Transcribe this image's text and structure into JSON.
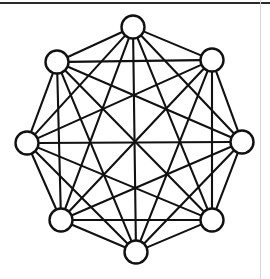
{
  "figure": {
    "title": "",
    "type": "graph-diagram",
    "background_color": "#ffffff",
    "ink_color": "#111111",
    "node_fill_color": "#ffffff",
    "top_rule_color": "#2a2a2a",
    "right_rule_color": "#d7d7d7"
  },
  "chart_data": {
    "type": "diagram",
    "graph_name": "complete graph K8",
    "node_count": 8,
    "edge_count": 28,
    "node_radius": 11.5,
    "layout": "octagonal ring, all pairs connected",
    "nodes": [
      {
        "id": "n0",
        "label": "",
        "x": 133,
        "y": 27,
        "position": "top"
      },
      {
        "id": "n1",
        "label": "",
        "x": 212,
        "y": 60,
        "position": "upper-right"
      },
      {
        "id": "n2",
        "label": "",
        "x": 242,
        "y": 142,
        "position": "right"
      },
      {
        "id": "n3",
        "label": "",
        "x": 212,
        "y": 220,
        "position": "lower-right"
      },
      {
        "id": "n4",
        "label": "",
        "x": 136,
        "y": 252,
        "position": "bottom"
      },
      {
        "id": "n5",
        "label": "",
        "x": 61,
        "y": 220,
        "position": "lower-left"
      },
      {
        "id": "n6",
        "label": "",
        "x": 27,
        "y": 143,
        "position": "left"
      },
      {
        "id": "n7",
        "label": "",
        "x": 57,
        "y": 62,
        "position": "upper-left"
      }
    ],
    "edges": [
      [
        "n0",
        "n1"
      ],
      [
        "n0",
        "n2"
      ],
      [
        "n0",
        "n3"
      ],
      [
        "n0",
        "n4"
      ],
      [
        "n0",
        "n5"
      ],
      [
        "n0",
        "n6"
      ],
      [
        "n0",
        "n7"
      ],
      [
        "n1",
        "n2"
      ],
      [
        "n1",
        "n3"
      ],
      [
        "n1",
        "n4"
      ],
      [
        "n1",
        "n5"
      ],
      [
        "n1",
        "n6"
      ],
      [
        "n1",
        "n7"
      ],
      [
        "n2",
        "n3"
      ],
      [
        "n2",
        "n4"
      ],
      [
        "n2",
        "n5"
      ],
      [
        "n2",
        "n6"
      ],
      [
        "n2",
        "n7"
      ],
      [
        "n3",
        "n4"
      ],
      [
        "n3",
        "n5"
      ],
      [
        "n3",
        "n6"
      ],
      [
        "n3",
        "n7"
      ],
      [
        "n4",
        "n5"
      ],
      [
        "n4",
        "n6"
      ],
      [
        "n4",
        "n7"
      ],
      [
        "n5",
        "n6"
      ],
      [
        "n5",
        "n7"
      ],
      [
        "n6",
        "n7"
      ]
    ]
  }
}
